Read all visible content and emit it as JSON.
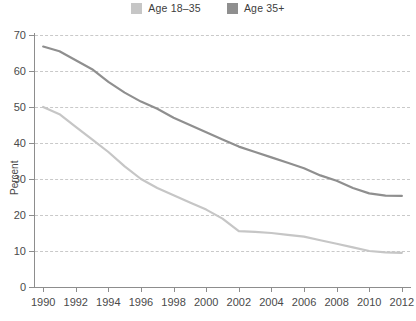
{
  "legend": {
    "position": "top-center",
    "items": [
      {
        "label": "Age 18–35",
        "color": "#c6c6c6",
        "name": "age-18-35"
      },
      {
        "label": "Age 35+",
        "color": "#8f8f8f",
        "name": "age-35-plus"
      }
    ]
  },
  "chart_data": {
    "type": "line",
    "title": "",
    "subtitle": "",
    "xlabel": "",
    "ylabel": "Percent",
    "grid": true,
    "legend_position": "top-center",
    "xlim": [
      1989.5,
      2012.5
    ],
    "ylim": [
      0,
      70
    ],
    "yticks": [
      0,
      10,
      20,
      30,
      40,
      50,
      60,
      70
    ],
    "xticks": [
      1990,
      1992,
      1994,
      1996,
      1998,
      2000,
      2002,
      2004,
      2006,
      2008,
      2010,
      2012
    ],
    "x": [
      1990,
      1991,
      1992,
      1993,
      1994,
      1995,
      1996,
      1997,
      1998,
      1999,
      2000,
      2001,
      2002,
      2003,
      2004,
      2005,
      2006,
      2007,
      2008,
      2009,
      2010,
      2011,
      2012
    ],
    "series": [
      {
        "name": "Age 18–35",
        "color": "#c6c6c6",
        "values": [
          50.0,
          48.0,
          44.5,
          41.0,
          37.5,
          33.5,
          30.0,
          27.5,
          25.5,
          23.5,
          21.5,
          19.0,
          15.5,
          15.3,
          15.0,
          14.5,
          14.0,
          13.0,
          12.0,
          11.0,
          10.0,
          9.6,
          9.5
        ]
      },
      {
        "name": "Age 35+",
        "color": "#8f8f8f",
        "values": [
          66.8,
          65.5,
          63.0,
          60.5,
          57.0,
          54.0,
          51.5,
          49.5,
          47.0,
          45.0,
          43.0,
          41.0,
          39.0,
          37.5,
          36.0,
          34.5,
          33.0,
          31.0,
          29.5,
          27.5,
          26.0,
          25.4,
          25.3
        ]
      }
    ]
  }
}
